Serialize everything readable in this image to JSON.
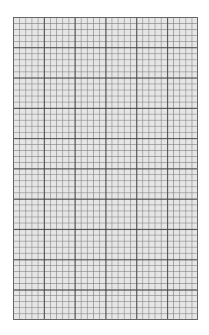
{
  "sheet": {
    "type": "graph-paper",
    "major_columns": 6,
    "major_rows": 10,
    "minor_subdivisions_per_major": 5,
    "colors": {
      "page_background": "#ffffff",
      "paper_fill": "#e6e6e6",
      "minor_line": "#999999",
      "major_line": "#3c3c3c",
      "border": "#666666"
    }
  }
}
